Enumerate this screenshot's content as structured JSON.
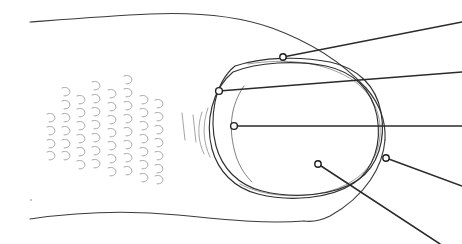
{
  "figure": {
    "kind": "hand-drawn anatomical line diagram",
    "canvas": {
      "width": 462,
      "height": 244,
      "background": "#ffffff"
    },
    "ink_colors": {
      "primary_outline": "#3b3b3b",
      "nail_outline": "#2f2f2f",
      "faint_inner_contour": "#8d8d8d",
      "lunula_arc": "#6f6f6f",
      "leader_line": "#2b2b2b",
      "marker_fill": "#ffffff",
      "marker_stroke": "#1f1f1f",
      "texture_stroke": "#9a9a9a"
    }
  },
  "body_outline": {
    "top_edge": "M 30 22 C 70 19 108 16 150 14 C 196 12 238 16 272 28 C 310 42 342 62 366 88",
    "bottom_edge": "M 30 219 C 78 212 126 210 178 215 C 226 220 268 224 304 221",
    "right_sweep_top": "M 366 88 C 380 104 386 122 385 140",
    "right_sweep_bottom": "M 385 140 C 383 166 366 196 330 216 C 320 221 312 222 304 221"
  },
  "nail": {
    "outer_capsule": "M 235 66 C 262 57 300 56 330 62 C 358 68 376 86 381 112 C 386 140 378 166 358 180 C 334 196 294 199 262 191 C 238 185 222 168 216 146 C 209 119 214 83 235 66",
    "outer_capsule_second": "M 233 72 C 258 62 296 60 326 66 C 354 72 372 90 377 116 C 382 143 374 169 354 183 C 330 199 290 202 258 194 C 234 188 218 171 212 149 C 205 122 212 89 233 72",
    "inner_faint_contour": "M 248 64 C 286 58 320 62 346 76 C 370 89 382 111 380 136 C 378 164 358 184 326 192 C 296 199 262 196 240 184",
    "lunula_arc": "M 244 86 C 230 106 228 130 236 156 C 240 168 246 176 252 182"
  },
  "annotations": [
    {
      "id": "annotation-1",
      "name": "nail-proximal-dorsal-point",
      "marker": {
        "x": 283,
        "y": 57,
        "r": 3.2
      },
      "line_to": {
        "x": 462,
        "y": 22
      }
    },
    {
      "id": "annotation-2",
      "name": "nail-proximal-fold-point",
      "marker": {
        "x": 219,
        "y": 91,
        "r": 3.4
      },
      "line_to": {
        "x": 462,
        "y": 72
      }
    },
    {
      "id": "annotation-3",
      "name": "nail-bed-center-point",
      "marker": {
        "x": 234,
        "y": 126,
        "r": 3.4
      },
      "line_to": {
        "x": 462,
        "y": 126
      }
    },
    {
      "id": "annotation-4",
      "name": "nail-lateral-margin-point",
      "marker": {
        "x": 386,
        "y": 158,
        "r": 3.2
      },
      "line_to": {
        "x": 462,
        "y": 186
      }
    },
    {
      "id": "annotation-5",
      "name": "nail-distal-pulp-point",
      "marker": {
        "x": 318,
        "y": 164,
        "r": 3.2
      },
      "line_to": {
        "x": 440,
        "y": 244
      }
    }
  ],
  "texture": {
    "label": "skin ridge / scale hatching",
    "columns": [
      {
        "x": 47,
        "marks": [
          114,
          127,
          140,
          152
        ]
      },
      {
        "x": 62,
        "marks": [
          88,
          101,
          114,
          127,
          140,
          152
        ]
      },
      {
        "x": 77,
        "marks": [
          96,
          109,
          122,
          135,
          148,
          161
        ]
      },
      {
        "x": 92,
        "marks": [
          82,
          95,
          108,
          121,
          134,
          147,
          160
        ]
      },
      {
        "x": 108,
        "marks": [
          90,
          103,
          116,
          129,
          142,
          155,
          168
        ]
      },
      {
        "x": 124,
        "marks": [
          76,
          89,
          102,
          115,
          128,
          141,
          154,
          167
        ]
      },
      {
        "x": 140,
        "marks": [
          96,
          109,
          122,
          135,
          148,
          161,
          174
        ]
      },
      {
        "x": 155,
        "marks": [
          100,
          113,
          126,
          139,
          152,
          165,
          176
        ]
      }
    ],
    "vertical_ticks": [
      {
        "x1": 182,
        "y1": 113,
        "x2": 185,
        "y2": 140
      },
      {
        "x1": 193,
        "y1": 115,
        "x2": 196,
        "y2": 142
      }
    ],
    "arc_ticks": [
      "M 202 112 C 197 127 198 141 204 154",
      "M 208 108 C 202 125 203 142 210 157"
    ],
    "speck": {
      "x": 31,
      "y": 200,
      "r": 1.1
    }
  }
}
